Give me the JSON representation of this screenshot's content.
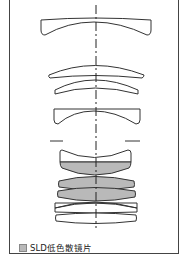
{
  "diagram": {
    "type": "lens-optical-construction",
    "optical_axis": "vertical dash-dot center line",
    "elements": [
      {
        "index": 1,
        "shape": "negative meniscus",
        "special": false
      },
      {
        "index": 2,
        "shape": "positive meniscus",
        "special": false
      },
      {
        "index": 3,
        "shape": "meniscus",
        "special": false
      },
      {
        "index": 4,
        "shape": "negative concave",
        "special": false
      },
      {
        "index": 5,
        "shape": "negative concave (cemented)",
        "special": false
      },
      {
        "index": 6,
        "shape": "biconvex",
        "special": true
      },
      {
        "index": 7,
        "shape": "biconvex",
        "special": true
      },
      {
        "index": 8,
        "shape": "biconvex",
        "special": true
      },
      {
        "index": 9,
        "shape": "biconvex/meniscus",
        "special": false
      },
      {
        "index": 10,
        "shape": "meniscus",
        "special": false
      }
    ],
    "aperture_stop": "short horizontal marks at both sides",
    "colors": {
      "outline": "#333333",
      "special_fill": "#b9b9b9",
      "normal_fill": "#ffffff"
    }
  },
  "legend": {
    "items": [
      {
        "label": "SLD低色散镜片",
        "color": "#b9b9b9"
      }
    ]
  }
}
